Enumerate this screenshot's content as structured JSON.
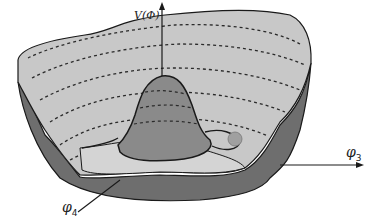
{
  "diagram": {
    "axes": {
      "vertical": {
        "label": "V(Φ)"
      },
      "horizontal": {
        "symbol": "φ",
        "subscript": "3"
      },
      "depth": {
        "symbol": "φ",
        "subscript": "4"
      }
    },
    "colors": {
      "inner_surface": "#c8c8c8",
      "outer_wall": "#6e6e6e",
      "hump": "#8a8a8a",
      "trough": "#d4d4d4",
      "outline": "#1a1a1a",
      "ball": "#a0a0a0"
    },
    "elements": {
      "ball": "ball-in-trough",
      "contours": "dashed equipotential lines"
    }
  }
}
